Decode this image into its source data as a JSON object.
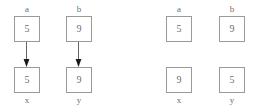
{
  "diagram": {
    "type": "variable-reference-swap",
    "colors": {
      "box_border": "#9a9a9a",
      "text": "#707070",
      "arrow": "#555555",
      "background": "#ffffff"
    },
    "groups": [
      {
        "id": "before",
        "has_arrows": true,
        "columns": [
          {
            "id": "a",
            "top_label": "a",
            "top_value": "5",
            "bottom_value": "5",
            "bottom_label": "x",
            "arrow": "down-arrow"
          },
          {
            "id": "b",
            "top_label": "b",
            "top_value": "9",
            "bottom_value": "9",
            "bottom_label": "y",
            "arrow": "down-arrow"
          }
        ]
      },
      {
        "id": "after",
        "has_arrows": false,
        "columns": [
          {
            "id": "a",
            "top_label": "a",
            "top_value": "5",
            "bottom_value": "9",
            "bottom_label": "x",
            "arrow": null
          },
          {
            "id": "b",
            "top_label": "b",
            "top_value": "9",
            "bottom_value": "5",
            "bottom_label": "y",
            "arrow": null
          }
        ]
      }
    ]
  }
}
